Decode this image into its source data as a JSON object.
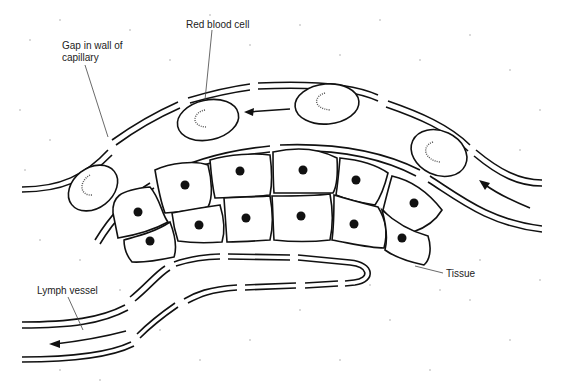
{
  "diagram": {
    "type": "biology-illustration",
    "labels": {
      "red_blood_cell": "Red blood cell",
      "gap_line1": "Gap in wall of",
      "gap_line2": "capillary",
      "tissue": "Tissue",
      "lymph_vessel": "Lymph vessel"
    },
    "structures": {
      "capillary_red_blood_cells": 4,
      "tissue_cells": 12,
      "flow_arrows": 3
    }
  }
}
